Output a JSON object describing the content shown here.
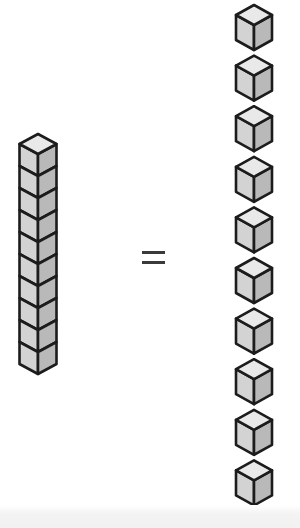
{
  "diagram": {
    "rod": {
      "units": 10,
      "label": "ten-rod"
    },
    "equals": {
      "symbol": "="
    },
    "unit_cubes": {
      "count": 10,
      "label": "unit cube"
    },
    "colors": {
      "top_face": "#e9e9e9",
      "left_face": "#d3d3d3",
      "right_face": "#b9b9b9",
      "outline": "#1c1c1c",
      "equals": "#3a3a3a"
    }
  }
}
